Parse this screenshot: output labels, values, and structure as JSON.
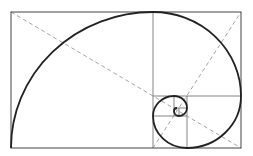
{
  "diagram": {
    "colors": {
      "background": "#ffffff",
      "frame": "#555555",
      "spiral": "#222222",
      "diagonal": "#9a9a9a"
    },
    "outer_rect": {
      "x": 11,
      "y": 12,
      "w": 230,
      "h": 136
    },
    "divisions": [
      {
        "x1": 153,
        "y1": 12,
        "x2": 153,
        "y2": 148
      },
      {
        "x1": 153,
        "y1": 96,
        "x2": 241,
        "y2": 96
      },
      {
        "x1": 187,
        "y1": 96,
        "x2": 187,
        "y2": 148
      },
      {
        "x1": 153,
        "y1": 116,
        "x2": 187,
        "y2": 116
      },
      {
        "x1": 174,
        "y1": 96,
        "x2": 174,
        "y2": 116
      },
      {
        "x1": 174,
        "y1": 108,
        "x2": 187,
        "y2": 108
      },
      {
        "x1": 179,
        "y1": 108,
        "x2": 179,
        "y2": 116
      }
    ],
    "diagonals": [
      {
        "x1": 11,
        "y1": 12,
        "x2": 241,
        "y2": 148
      },
      {
        "x1": 153,
        "y1": 148,
        "x2": 241,
        "y2": 12
      }
    ]
  }
}
